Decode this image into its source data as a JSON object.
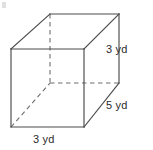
{
  "figure": {
    "name": "rectangular-prism",
    "shape_label": "rectangular prism",
    "units": "yd",
    "stroke_color": "#4a4a4a",
    "hidden_stroke_color": "#6e6e6e",
    "background_color": "#ffffff",
    "text_color": "#2b2b2b"
  },
  "labels": {
    "height": "3 yd",
    "depth": "5 yd",
    "width": "3 yd"
  },
  "dimensions": {
    "height_value": 3,
    "depth_value": 5,
    "width_value": 3,
    "unit": "yd"
  },
  "geometry": {
    "front_top_left": [
      11,
      49
    ],
    "front_top_right": [
      84,
      49
    ],
    "front_bottom_right": [
      84,
      127
    ],
    "front_bottom_left": [
      11,
      127
    ],
    "back_top_left": [
      50,
      14
    ],
    "back_top_right": [
      119,
      14
    ],
    "back_bottom_right": [
      119,
      83
    ],
    "back_bottom_left": [
      50,
      83
    ],
    "solid_edges": [
      "front-top",
      "front-right",
      "front-bottom",
      "front-left",
      "back-top",
      "back-right",
      "top-left-diagonal",
      "top-right-diagonal",
      "bottom-right-diagonal"
    ],
    "hidden_edges": [
      "back-left-vertical",
      "back-bottom-horizontal",
      "bottom-left-diagonal"
    ]
  }
}
